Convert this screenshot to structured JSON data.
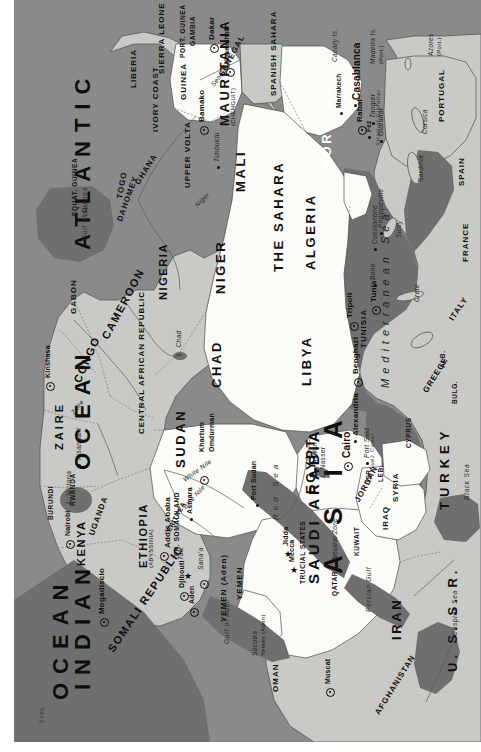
{
  "map": {
    "title": "Africa and the Middle East",
    "orientation": "rotated-90-clockwise",
    "copyright": "© FPG",
    "colors": {
      "ocean": "#8a8a8a",
      "sea_dark": "#6f6f6f",
      "land_other": "#c9c9c6",
      "land_highlight": "#fdfdfb",
      "border": "#4a4a4a",
      "text": "#101010"
    },
    "legend_note": "Arab / highlighted states drawn in white, other land in light grey, water in grey"
  },
  "oceans": [
    {
      "name": "ATLANTIC",
      "name2": "OCEAN"
    },
    {
      "name": "INDIAN",
      "name2": "OCEAN"
    }
  ],
  "seas": [
    {
      "label": "Mediterranean Sea"
    },
    {
      "label": "Red Sea"
    },
    {
      "label": "Black Sea"
    },
    {
      "label": "Caspian Sea"
    },
    {
      "label": "Persian Gulf"
    },
    {
      "label": "Gulf of Aden"
    },
    {
      "label": "Gulf of Guinea"
    },
    {
      "label": "Strait of Gibraltar"
    },
    {
      "label": "Suez Canal"
    }
  ],
  "continents": [
    {
      "label": "A S I A"
    }
  ],
  "countries": [
    {
      "label": "MAURITANIA",
      "sub": "(CHENGUIT)"
    },
    {
      "label": "SPANISH SAHARA"
    },
    {
      "label": "MOROCCO"
    },
    {
      "label": "ALGERIA"
    },
    {
      "label": "THE SAHARA"
    },
    {
      "label": "LIBYA"
    },
    {
      "label": "TUNISIA"
    },
    {
      "label": "EGYPT"
    },
    {
      "label": "SUDAN"
    },
    {
      "label": "MALI"
    },
    {
      "label": "NIGER"
    },
    {
      "label": "CHAD"
    },
    {
      "label": "NIGERIA"
    },
    {
      "label": "CAMEROON"
    },
    {
      "label": "CENTRAL AFRICAN REPUBLIC"
    },
    {
      "label": "GABON"
    },
    {
      "label": "CONGO"
    },
    {
      "label": "ZAIRE"
    },
    {
      "label": "RWANDA"
    },
    {
      "label": "BURUNDI"
    },
    {
      "label": "UGANDA"
    },
    {
      "label": "KENYA"
    },
    {
      "label": "ETHIOPIA",
      "sub": "(ABYSSINIA)"
    },
    {
      "label": "SOMALI REPUBLIC"
    },
    {
      "label": "FR. SOMALILAND"
    },
    {
      "label": "ERITREA"
    },
    {
      "label": "SENEGAL"
    },
    {
      "label": "GAMBIA"
    },
    {
      "label": "PORT. GUINEA"
    },
    {
      "label": "GUINEA"
    },
    {
      "label": "SIERRA LEONE"
    },
    {
      "label": "LIBERIA"
    },
    {
      "label": "IVORY COAST"
    },
    {
      "label": "GHANA"
    },
    {
      "label": "TOGO"
    },
    {
      "label": "DAHOMEY"
    },
    {
      "label": "UPPER VOLTA"
    },
    {
      "label": "EQUAT. GUINEA",
      "sub": "(Sp.)"
    },
    {
      "label": "SAUDI ARABIA"
    },
    {
      "label": "YEMEN"
    },
    {
      "label": "YEMEN (Aden)"
    },
    {
      "label": "OMAN"
    },
    {
      "label": "QATAR"
    },
    {
      "label": "TRUCIAL STATES"
    },
    {
      "label": "KUWAIT"
    },
    {
      "label": "IRAQ"
    },
    {
      "label": "IRAN"
    },
    {
      "label": "JORDAN"
    },
    {
      "label": "SYRIA"
    },
    {
      "label": "LEB."
    },
    {
      "label": "ISR."
    },
    {
      "label": "TURKEY"
    },
    {
      "label": "CYPRUS"
    },
    {
      "label": "U. S. S. R."
    },
    {
      "label": "AFGHANISTAN"
    },
    {
      "label": "PORTUGAL"
    },
    {
      "label": "SPAIN"
    },
    {
      "label": "FRANCE"
    },
    {
      "label": "ITALY"
    },
    {
      "label": "GREECE"
    },
    {
      "label": "ALB."
    },
    {
      "label": "BULG."
    }
  ],
  "cities": [
    {
      "label": "Dakar",
      "type": "capital"
    },
    {
      "label": "Nouakchott",
      "type": "capital"
    },
    {
      "label": "Bamako",
      "type": "capital"
    },
    {
      "label": "Timbuktu",
      "type": "town"
    },
    {
      "label": "Casablanca",
      "type": "town"
    },
    {
      "label": "Rabat",
      "type": "capital"
    },
    {
      "label": "Marrakech",
      "type": "town"
    },
    {
      "label": "Fez",
      "type": "town"
    },
    {
      "label": "Tangier",
      "type": "town"
    },
    {
      "label": "Gibraltar",
      "type": "town"
    },
    {
      "label": "Philippeville",
      "type": "town"
    },
    {
      "label": "Constantine",
      "type": "town"
    },
    {
      "label": "Bone",
      "type": "town"
    },
    {
      "label": "Tunis",
      "type": "capital"
    },
    {
      "label": "Tripoli",
      "type": "capital"
    },
    {
      "label": "Benghazi",
      "type": "town"
    },
    {
      "label": "Alexandria",
      "type": "town"
    },
    {
      "label": "Cairo",
      "type": "capital"
    },
    {
      "label": "Port Said",
      "type": "town"
    },
    {
      "label": "Aswan",
      "type": "town"
    },
    {
      "label": "Omdurman",
      "type": "town"
    },
    {
      "label": "Khartum",
      "type": "capital"
    },
    {
      "label": "Port Sudan",
      "type": "town"
    },
    {
      "label": "Asmara",
      "type": "town"
    },
    {
      "label": "Addis Ababa",
      "type": "capital"
    },
    {
      "label": "Djibouti",
      "type": "capital"
    },
    {
      "label": "Taiz",
      "type": "star"
    },
    {
      "label": "Sana'a",
      "type": "capital"
    },
    {
      "label": "Aden",
      "type": "capital"
    },
    {
      "label": "Mogadiscio",
      "type": "capital"
    },
    {
      "label": "Nairobi",
      "type": "capital"
    },
    {
      "label": "Kinshasa",
      "type": "capital"
    },
    {
      "label": "Kisangani",
      "type": "town"
    },
    {
      "label": "Jidda",
      "type": "star"
    },
    {
      "label": "Mecca",
      "type": "star"
    },
    {
      "label": "Muscat",
      "type": "capital"
    }
  ],
  "physical": [
    {
      "label": "Nile"
    },
    {
      "label": "White Nile"
    },
    {
      "label": "Blue Nile"
    },
    {
      "label": "L. Nasser"
    },
    {
      "label": "L. Chad"
    },
    {
      "label": "L. Victoria"
    },
    {
      "label": "Niger"
    },
    {
      "label": "Senegal"
    },
    {
      "label": "Zaire"
    },
    {
      "label": "Neutral Zone"
    },
    {
      "label": "Socotra",
      "sub": "Yemen (Aden)"
    },
    {
      "label": "Azores",
      "sub": "(Port.)"
    },
    {
      "label": "Madeira Is.",
      "sub": "(Port.)"
    },
    {
      "label": "Canary Is.",
      "sub": "(Sp.)"
    },
    {
      "label": "Corsica"
    },
    {
      "label": "Sardinia"
    },
    {
      "label": "Sicily"
    },
    {
      "label": "Crete"
    }
  ]
}
